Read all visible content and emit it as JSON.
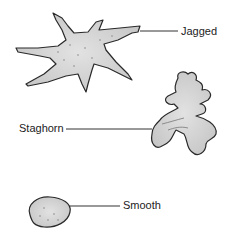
{
  "diagram": {
    "labels": {
      "jagged": "Jagged",
      "staghorn": "Staghorn",
      "smooth": "Smooth"
    },
    "colors": {
      "fill": "#d2d2d2",
      "stroke": "#2a2a2a",
      "leader": "#333333"
    }
  }
}
